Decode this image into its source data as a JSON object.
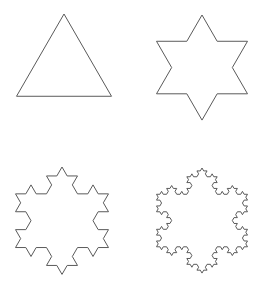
{
  "diagram": {
    "stroke_color": "#5a5a5a",
    "stroke_width": 1,
    "background": "#ffffff",
    "figures": [
      {
        "name": "koch-iteration-0",
        "iteration": 0,
        "apex": [
          64,
          14
        ],
        "side": 95
      },
      {
        "name": "koch-iteration-1",
        "iteration": 1,
        "apex": [
          202,
          15
        ],
        "side": 91
      },
      {
        "name": "koch-iteration-2",
        "iteration": 2,
        "apex": [
          62,
          167
        ],
        "side": 93
      },
      {
        "name": "koch-iteration-3",
        "iteration": 3,
        "apex": [
          202,
          168
        ],
        "side": 91
      }
    ]
  }
}
